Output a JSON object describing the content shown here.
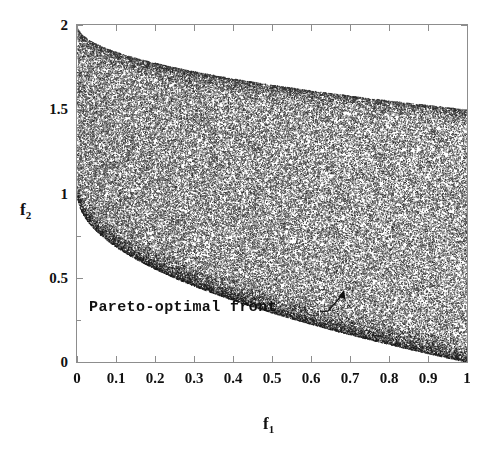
{
  "chart_data": {
    "type": "scatter",
    "title": "",
    "subtitle": "",
    "xlabel": "f_1",
    "ylabel": "f_2",
    "xlabel_display": "f",
    "xlabel_sub": "1",
    "ylabel_display": "f",
    "ylabel_sub": "2",
    "xlim": [
      0,
      1
    ],
    "ylim": [
      0,
      2
    ],
    "grid": false,
    "legend": "none",
    "x_ticks": [
      0,
      0.1,
      0.2,
      0.3,
      0.4,
      0.5,
      0.6,
      0.7,
      0.8,
      0.9,
      1
    ],
    "x_tick_labels": [
      "0",
      "0.1",
      "0.2",
      "0.3",
      "0.4",
      "0.5",
      "0.6",
      "0.7",
      "0.8",
      "0.9",
      "1"
    ],
    "y_ticks": [
      0,
      0.5,
      1,
      1.5,
      2
    ],
    "y_tick_labels": [
      "0",
      "0.5",
      "1",
      "1.5",
      "2"
    ],
    "y_minor_ticks": [
      0.25,
      0.75,
      1.25,
      1.75
    ],
    "series": [
      {
        "name": "feasible objective space",
        "kind": "dense-point-cloud",
        "marker": "dot",
        "color": "#3a3a3a",
        "point_count": 30000,
        "description": "Uniform random points filling the region between the lower boundary f2 = 1 - sqrt(f1) and the upper boundary f2 = 2 - 0.5*sqrt(f1), for f1 in [0,1].",
        "lower_boundary": {
          "label": "Pareto-optimal front",
          "formula": "f2 = 1 - sqrt(f1)",
          "points": [
            {
              "f1": 0.0,
              "f2": 1.0
            },
            {
              "f1": 0.1,
              "f2": 0.684
            },
            {
              "f1": 0.2,
              "f2": 0.553
            },
            {
              "f1": 0.3,
              "f2": 0.452
            },
            {
              "f1": 0.4,
              "f2": 0.368
            },
            {
              "f1": 0.5,
              "f2": 0.293
            },
            {
              "f1": 0.6,
              "f2": 0.225
            },
            {
              "f1": 0.7,
              "f2": 0.163
            },
            {
              "f1": 0.8,
              "f2": 0.106
            },
            {
              "f1": 0.9,
              "f2": 0.051
            },
            {
              "f1": 1.0,
              "f2": 0.0
            }
          ]
        },
        "upper_boundary": {
          "formula": "f2 = 2 - 0.5*sqrt(f1)",
          "points": [
            {
              "f1": 0.0,
              "f2": 2.0
            },
            {
              "f1": 0.1,
              "f2": 1.842
            },
            {
              "f1": 0.2,
              "f2": 1.776
            },
            {
              "f1": 0.3,
              "f2": 1.726
            },
            {
              "f1": 0.4,
              "f2": 1.684
            },
            {
              "f1": 0.5,
              "f2": 1.646
            },
            {
              "f1": 0.6,
              "f2": 1.613
            },
            {
              "f1": 0.7,
              "f2": 1.582
            },
            {
              "f1": 0.8,
              "f2": 1.553
            },
            {
              "f1": 0.9,
              "f2": 1.526
            },
            {
              "f1": 1.0,
              "f2": 1.5
            }
          ]
        }
      }
    ],
    "annotations": [
      {
        "text": "Pareto-optimal front",
        "points_to": {
          "f1": 0.68,
          "f2": 0.215
        },
        "leader": true,
        "arrow": true
      }
    ]
  },
  "annotation": {
    "pareto_label": "Pareto-optimal front"
  }
}
